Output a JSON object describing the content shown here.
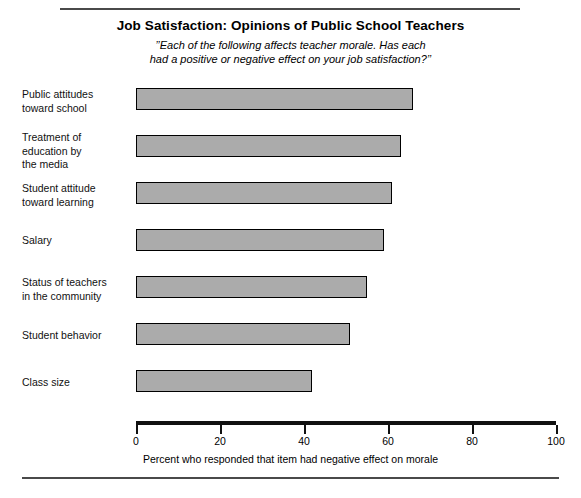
{
  "chart_data": {
    "type": "bar",
    "orientation": "horizontal",
    "title": "Job Satisfaction: Opinions of Public School Teachers",
    "subtitle_lines": [
      "’’Each of the following affects teacher morale. Has each",
      "had a positive or negative effect on your job satisfaction?’’"
    ],
    "categories": [
      "Public attitudes toward school",
      "Treatment of education by the media",
      "Student attitude toward learning",
      "Salary",
      "Status of teachers in the community",
      "Student behavior",
      "Class size"
    ],
    "category_lines": [
      [
        "Public attitudes",
        "toward school"
      ],
      [
        "Treatment of",
        "education by",
        "the media"
      ],
      [
        "Student attitude",
        "toward learning"
      ],
      [
        "Salary"
      ],
      [
        "Status of teachers",
        "in the community"
      ],
      [
        "Student behavior"
      ],
      [
        "Class size"
      ]
    ],
    "values": [
      66,
      63,
      61,
      59,
      55,
      51,
      42
    ],
    "xlabel": "Percent who responded that item had negative effect on morale",
    "ylabel": "",
    "xlim": [
      0,
      100
    ],
    "xticks": [
      0,
      20,
      40,
      60,
      80,
      100
    ],
    "xtick_labels": [
      "0",
      "20",
      "40",
      "60",
      "80",
      "100"
    ],
    "grid": false,
    "legend": false,
    "bar_fill_color": "#ababab",
    "bar_edge_color": "#000000",
    "axis_color": "#111111",
    "rule_color": "#4a4a4a"
  },
  "footer": {
    "caption": ""
  }
}
